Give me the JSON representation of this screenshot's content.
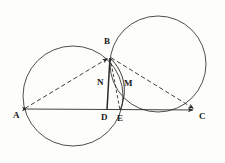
{
  "figure": {
    "background_color": "#fdfdfb",
    "stroke_color": "#2b2b2b",
    "label_color": "#1a1a1a"
  },
  "labels": {
    "A": "A",
    "B": "B",
    "C": "C",
    "D": "D",
    "E": "E",
    "M": "M",
    "N": "N"
  },
  "chart_data": {
    "type": "diagram",
    "points": [
      {
        "name": "A",
        "x": 24,
        "y": 109,
        "label_x": 13,
        "label_y": 112
      },
      {
        "name": "B",
        "x": 110,
        "y": 57,
        "label_x": 104,
        "label_y": 38
      },
      {
        "name": "C",
        "x": 196,
        "y": 110,
        "label_x": 199,
        "label_y": 113
      },
      {
        "name": "D",
        "x": 107,
        "y": 110,
        "label_x": 101,
        "label_y": 114
      },
      {
        "name": "E",
        "x": 120,
        "y": 110,
        "label_x": 117,
        "label_y": 115
      },
      {
        "name": "M",
        "x": 122,
        "y": 90,
        "label_x": 124,
        "label_y": 80
      },
      {
        "name": "N",
        "x": 108,
        "y": 88,
        "label_x": 97,
        "label_y": 79
      }
    ],
    "circles": [
      {
        "name": "left-circle",
        "cx": 73,
        "cy": 96,
        "r": 50
      },
      {
        "name": "right-circle",
        "cx": 158,
        "cy": 64,
        "r": 48
      }
    ],
    "segments": [
      {
        "name": "segment-AC",
        "from": "A",
        "to": "C",
        "style": "solid",
        "arrows": "both"
      },
      {
        "name": "segment-BD",
        "from": "B",
        "to": "D",
        "style": "solid",
        "arrows": "none"
      },
      {
        "name": "segment-AB",
        "from": "A",
        "to": "B",
        "style": "dashed",
        "arrows": "end"
      },
      {
        "name": "segment-BC",
        "from": "B",
        "to": "C",
        "style": "dashed",
        "arrows": "end"
      },
      {
        "name": "segment-BE",
        "from": "B",
        "to": "E",
        "style": "dashed",
        "arrows": "none"
      }
    ],
    "arcs": [
      {
        "name": "arc-BE",
        "from": "B",
        "to": "E",
        "bulge": "right",
        "style": "solid"
      }
    ],
    "xlabel": "",
    "ylabel": "",
    "grid": false,
    "legend": "none"
  }
}
